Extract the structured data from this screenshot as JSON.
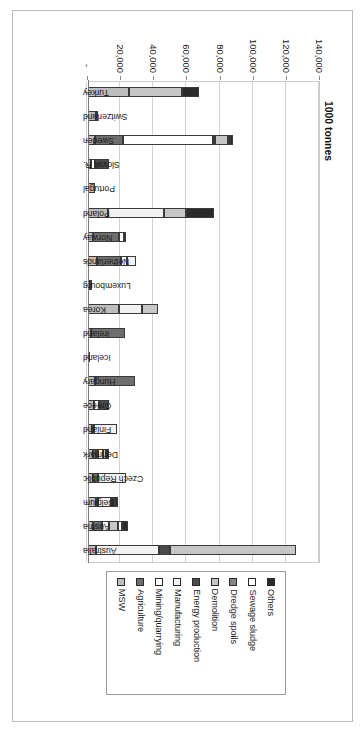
{
  "figure": {
    "axis_title": "1000 tonnes",
    "value_tick_labels": [
      "-",
      "20,000",
      "40,000",
      "60,000",
      "80,000",
      "100,000",
      "120,000",
      "140,000"
    ],
    "value_tick_values": [
      0,
      20000,
      40000,
      60000,
      80000,
      100000,
      120000,
      140000
    ]
  },
  "legend": {
    "items": [
      {
        "label": "Others",
        "color": "#2b2b2b"
      },
      {
        "label": "Sewage sludge",
        "color": "#ffffff"
      },
      {
        "label": "Dredge spoils",
        "color": "#848484"
      },
      {
        "label": "Demolition",
        "color": "#c6c6c6"
      },
      {
        "label": "Energy production",
        "color": "#4a4a4a"
      },
      {
        "label": "Manufacturing",
        "color": "#f2f2f2"
      },
      {
        "label": "Mining/quarrying",
        "color": "#ffffff"
      },
      {
        "label": "Agriculture",
        "color": "#6e6e6e"
      },
      {
        "label": "MSW",
        "color": "#bdbdbd"
      }
    ]
  },
  "chart_data": {
    "type": "bar",
    "orientation": "horizontal",
    "stacked": true,
    "title": "",
    "xlabel": "1000 tonnes",
    "ylabel": "",
    "xlim": [
      0,
      140000
    ],
    "grid": true,
    "legend_position": "top",
    "categories": [
      "Australia",
      "Austria",
      "Belgium",
      "Czech Republic",
      "Denmark",
      "Finland",
      "Greece",
      "Hungary",
      "Iceland",
      "Ireland",
      "Korea",
      "Luxembourg",
      "Netherlands",
      "Norway",
      "Poland",
      "Portugal",
      "Slovak R.",
      "Sweden",
      "Switzerland",
      "Turkey"
    ],
    "series": [
      {
        "name": "MSW",
        "color": "#bdbdbd",
        "values": [
          5000,
          3100,
          4800,
          3200,
          3100,
          2400,
          3900,
          4400,
          200,
          2100,
          18500,
          300,
          5200,
          2800,
          11900,
          4500,
          1700,
          4200,
          4700,
          25000
        ]
      },
      {
        "name": "Agriculture",
        "color": "#6e6e6e",
        "values": [
          0,
          5400,
          0,
          2700,
          2200,
          1300,
          0,
          24000,
          0,
          20000,
          0,
          0,
          15000,
          16000,
          0,
          0,
          0,
          17000,
          0,
          0
        ]
      },
      {
        "name": "Mining/quarrying",
        "color": "#ffffff",
        "values": [
          0,
          0,
          1000,
          0,
          600,
          0,
          2600,
          0,
          0,
          0,
          0,
          0,
          3400,
          3000,
          0,
          0,
          2400,
          54000,
          0,
          0
        ]
      },
      {
        "name": "Manufacturing",
        "color": "#f2f2f2",
        "values": [
          38000,
          3900,
          8000,
          17000,
          2700,
          14000,
          0,
          0,
          0,
          0,
          14000,
          600,
          5400,
          0,
          34000,
          0,
          0,
          0,
          0,
          0
        ]
      },
      {
        "name": "Energy production",
        "color": "#4a4a4a",
        "values": [
          6500,
          0,
          1200,
          0,
          0,
          0,
          6200,
          0,
          0,
          0,
          0,
          0,
          0,
          1200,
          0,
          0,
          8600,
          1200,
          1300,
          0
        ]
      },
      {
        "name": "Demolition",
        "color": "#c6c6c6",
        "values": [
          76000,
          6000,
          1500,
          0,
          2000,
          0,
          0,
          0,
          0,
          0,
          10000,
          0,
          0,
          0,
          13000,
          0,
          0,
          8000,
          0,
          32000
        ]
      },
      {
        "name": "Dredge spoils",
        "color": "#848484",
        "values": [
          0,
          0,
          0,
          0,
          0,
          0,
          0,
          0,
          0,
          0,
          0,
          0,
          0,
          0,
          0,
          0,
          0,
          1200,
          0,
          0
        ]
      },
      {
        "name": "Sewage sludge",
        "color": "#ffffff",
        "values": [
          0,
          2100,
          0,
          0,
          0,
          0,
          0,
          0,
          0,
          0,
          0,
          0,
          0,
          0,
          0,
          0,
          0,
          0,
          0,
          0
        ]
      },
      {
        "name": "Others",
        "color": "#2b2b2b",
        "values": [
          0,
          3600,
          1800,
          0,
          2000,
          0,
          0,
          0,
          0,
          0,
          0,
          0,
          0,
          0,
          17000,
          0,
          0,
          1800,
          0,
          10000
        ]
      }
    ]
  }
}
